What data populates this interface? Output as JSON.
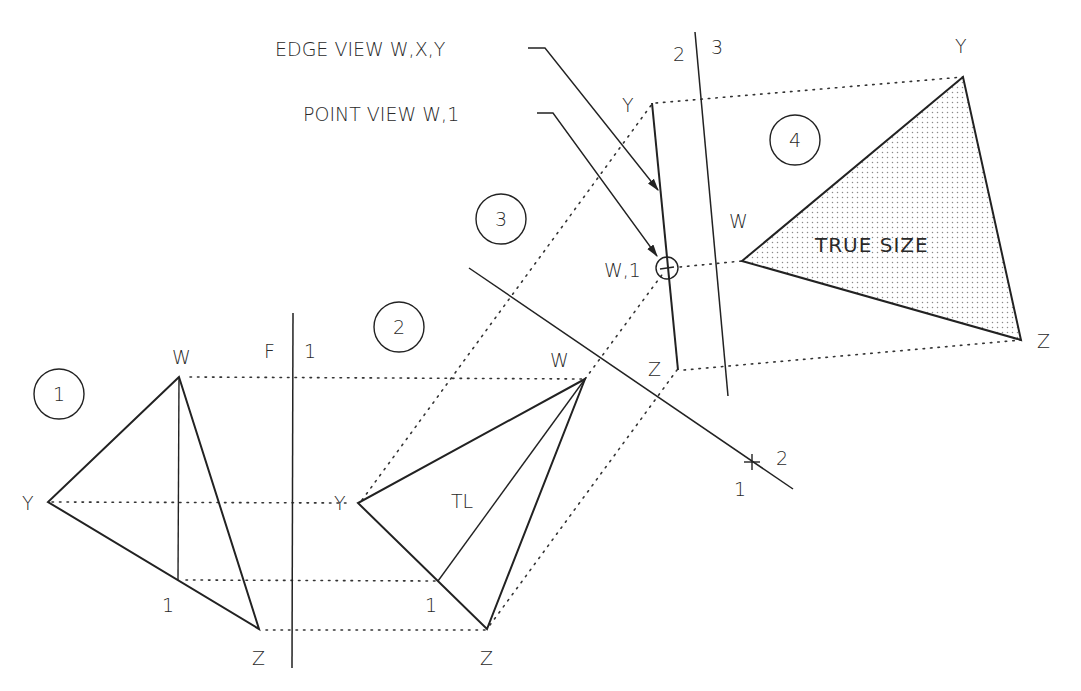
{
  "diagram": {
    "colors": {
      "line": "#222222",
      "background": "#ffffff",
      "shading": "#9a9a9a"
    },
    "callouts": {
      "edge_view": "EDGE VIEW W,X,Y",
      "point_view": "POINT VIEW W,1"
    },
    "view_badges": [
      "1",
      "2",
      "3",
      "4"
    ],
    "fold_lines": {
      "f1": {
        "left": "F",
        "right": "1"
      },
      "f12": {
        "left": "1",
        "right": "2"
      },
      "f23": {
        "left": "2",
        "right": "3"
      }
    },
    "view1": {
      "W": "W",
      "Y": "Y",
      "Z": "Z",
      "P1": "1"
    },
    "view2": {
      "W": "W",
      "Y": "Y",
      "Z": "Z",
      "P1": "1",
      "TL": "TL"
    },
    "view3": {
      "Y": "Y",
      "W1": "W,1",
      "Z": "Z"
    },
    "view4": {
      "Y": "Y",
      "W": "W",
      "Z": "Z",
      "true_size": "TRUE SIZE"
    }
  }
}
